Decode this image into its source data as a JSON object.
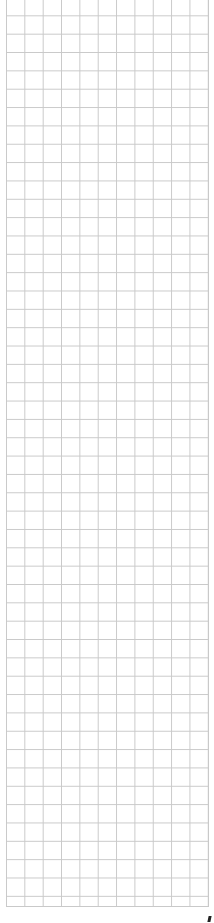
{
  "page": {
    "type": "graph-paper",
    "background_color": "#ffffff",
    "grid": {
      "line_color": "#c9c9c9",
      "columns": 11,
      "rows": 50,
      "cell_size_px": 18.35
    },
    "corner_mark": {
      "color": "#222222"
    }
  }
}
